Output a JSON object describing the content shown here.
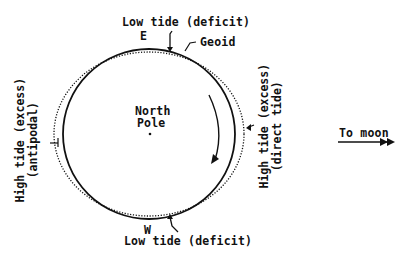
{
  "diagram": {
    "center_label": "North\nPole",
    "center_label_lines": [
      "North",
      "Pole"
    ],
    "top_label": "Low tide (deficit)",
    "top_direction": "E",
    "geoid_label": "Geoid",
    "bottom_label": "Low tide (deficit)",
    "bottom_direction": "W",
    "left_label_line1": "High tide (excess)",
    "left_label_line2": "(antipodal)",
    "right_label_line1": "High tide (excess)",
    "right_label_line2": "(direct tide)",
    "moon_label": "To moon",
    "rotation_arrow": "clockwise"
  },
  "colors": {
    "ink": "#111111",
    "background": "#ffffff"
  }
}
